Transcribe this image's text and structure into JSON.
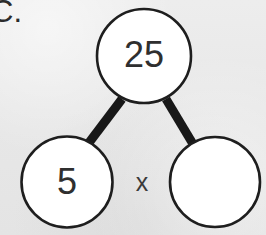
{
  "page": {
    "background_color": "#e9e9e9",
    "ink_color": "#222222",
    "node_fill": "#ffffff"
  },
  "problem": {
    "label": "C."
  },
  "factor_tree": {
    "root": {
      "value": "25",
      "filled": true
    },
    "operator": "x",
    "children": [
      {
        "value": "5",
        "filled": true
      },
      {
        "value": "",
        "filled": false
      }
    ]
  }
}
